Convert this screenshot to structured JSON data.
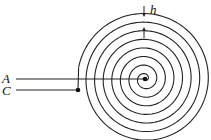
{
  "diagram": {
    "type": "archimedean-spiral-coil",
    "labels": {
      "A": "A",
      "C": "C",
      "h": "h"
    },
    "spiral": {
      "center": [
        145,
        79
      ],
      "turns": 7.6,
      "spacing_px": 8.6,
      "start_radius": 2,
      "stroke_color": "#222222"
    },
    "lines": {
      "A": {
        "x1": 16,
        "x2": 145,
        "y": 79
      },
      "C": {
        "x1": 16,
        "x2": 78,
        "y": 90
      }
    },
    "dots": {
      "center": [
        145,
        79
      ],
      "outer_end": [
        78,
        90
      ]
    },
    "h_marker": {
      "x": 144,
      "top_arrow_from": 6,
      "top_arrow_to": 17,
      "bottom_arrow_from": 38,
      "bottom_arrow_to": 27
    }
  }
}
